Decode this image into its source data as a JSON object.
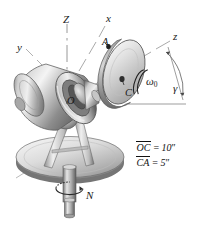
{
  "figure": {
    "background_color": "#ffffff",
    "ink_color": "#1a1a1a",
    "metal_light": "#f2f2f2",
    "metal_mid": "#b9b9b9",
    "metal_dark": "#6f6f6f",
    "metal_shadow": "#4a4a4a"
  },
  "axes": [
    {
      "name": "axis-label-Z",
      "label": "Z",
      "x": 63,
      "y": 14
    },
    {
      "name": "axis-label-x",
      "label": "x",
      "x": 106,
      "y": 13
    },
    {
      "name": "axis-label-y",
      "label": "y",
      "x": 17,
      "y": 42
    },
    {
      "name": "axis-label-z",
      "label": "z",
      "x": 173,
      "y": 31
    }
  ],
  "points": [
    {
      "name": "point-label-A",
      "label": "A",
      "x": 102,
      "y": 37
    },
    {
      "name": "point-label-C",
      "label": "C",
      "x": 125,
      "y": 88
    },
    {
      "name": "point-label-O",
      "label": "O",
      "x": 67,
      "y": 96
    }
  ],
  "annotations": [
    {
      "name": "angular-velocity-omega-zero",
      "label": "ω",
      "subscript": "0",
      "x": 146,
      "y": 76
    },
    {
      "name": "angle-gamma",
      "label": "γ",
      "x": 173,
      "y": 83
    },
    {
      "name": "base-rotation-N",
      "label": "N",
      "x": 86,
      "y": 196
    }
  ],
  "dimensions": {
    "name": "dimension-notes",
    "rows": [
      {
        "segment": "OC",
        "equals": "=",
        "value": "10",
        "unit": "″"
      },
      {
        "segment": "CA",
        "equals": "=",
        "value": "5",
        "unit": "″"
      }
    ],
    "line1_text": "OC = 10″",
    "line2_text": "CA = 5″"
  }
}
